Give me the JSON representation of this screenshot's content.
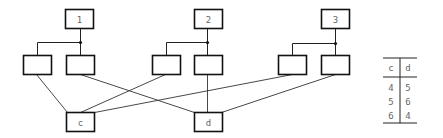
{
  "diagram": {
    "top_nodes": [
      {
        "label": "1",
        "x": 65,
        "y": 9,
        "w": 28,
        "h": 19
      },
      {
        "label": "2",
        "x": 194,
        "y": 9,
        "w": 28,
        "h": 19
      },
      {
        "label": "3",
        "x": 321,
        "y": 9,
        "w": 28,
        "h": 19
      }
    ],
    "junctions": [
      {
        "x": 80,
        "y": 42
      },
      {
        "x": 207,
        "y": 42
      },
      {
        "x": 335,
        "y": 43
      }
    ],
    "child_nodes": [
      {
        "x": 23,
        "y": 55,
        "w": 28,
        "h": 19
      },
      {
        "x": 66,
        "y": 55,
        "w": 28,
        "h": 19
      },
      {
        "x": 152,
        "y": 55,
        "w": 28,
        "h": 19
      },
      {
        "x": 194,
        "y": 55,
        "w": 28,
        "h": 19
      },
      {
        "x": 278,
        "y": 55,
        "w": 28,
        "h": 19
      },
      {
        "x": 321,
        "y": 55,
        "w": 28,
        "h": 19
      }
    ],
    "bottom_nodes": [
      {
        "label": "c",
        "x": 66,
        "y": 112,
        "w": 28,
        "h": 19
      },
      {
        "label": "d",
        "x": 194,
        "y": 112,
        "w": 28,
        "h": 19
      }
    ],
    "connections": [
      {
        "from": [
          36,
          74
        ],
        "to": [
          67,
          112
        ]
      },
      {
        "from": [
          80,
          74
        ],
        "to": [
          194,
          112
        ]
      },
      {
        "from": [
          165,
          74
        ],
        "to": [
          80,
          112
        ]
      },
      {
        "from": [
          207,
          74
        ],
        "to": [
          207,
          112
        ]
      },
      {
        "from": [
          292,
          74
        ],
        "to": [
          94,
          112
        ]
      },
      {
        "from": [
          335,
          74
        ],
        "to": [
          221,
          112
        ]
      }
    ]
  },
  "table": {
    "headers": [
      "c",
      "d"
    ],
    "rows": [
      [
        "4",
        "5"
      ],
      [
        "5",
        "6"
      ],
      [
        "6",
        "4"
      ]
    ]
  }
}
